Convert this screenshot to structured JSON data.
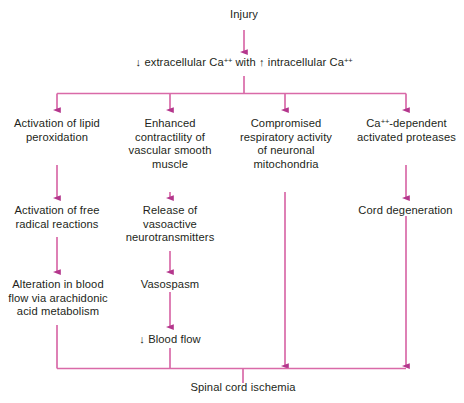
{
  "diagram": {
    "colors": {
      "connector": "#d96aa8",
      "arrowhead": "#b4368c",
      "text": "#231f20",
      "background": "#ffffff"
    },
    "nodes": {
      "injury": "Injury",
      "calcium_shift_pre": "↓ extracellular Ca",
      "calcium_shift_mid": " with ↑ intracellular Ca",
      "calcium_sup": "++",
      "col1_r1": "Activation of lipid\nperoxidation",
      "col1_r2": "Activation of free\nradical reactions",
      "col1_r3": "Alteration in blood\nflow via arachidonic\nacid metabolism",
      "col2_r1": "Enhanced\ncontractility of\nvascular smooth\nmuscle",
      "col2_r2": "Release of\nvasoactive\nneurotransmitters",
      "col2_r3": "Vasospasm",
      "col2_r4": "↓ Blood flow",
      "col3_r1": "Compromised\nrespiratory activity\nof neuronal\nmitochondria",
      "col4_r1_pre": "Ca",
      "col4_r1_sup": "++",
      "col4_r1_post": "-dependent\nactivated proteases",
      "col4_r2": "Cord degeneration",
      "outcome": "Spinal cord ischemia"
    }
  }
}
